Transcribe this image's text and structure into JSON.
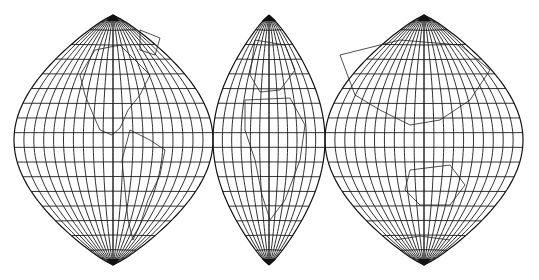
{
  "map": {
    "title": "Interrupted world map projection with three lobes",
    "projection": "interrupted conic-like lobes (Americas, Europe-Africa, Asia-Australia)",
    "colors": {
      "background": "#ffffff",
      "lines": "#1a1a1a"
    },
    "lobes": [
      {
        "name": "Americas",
        "cx": 113,
        "left": 14,
        "right": 213,
        "top": 15,
        "bottom": 265
      },
      {
        "name": "Europe-Africa",
        "cx": 269,
        "left": 213,
        "right": 325,
        "top": 15,
        "bottom": 265
      },
      {
        "name": "Asia-Australia",
        "cx": 424,
        "left": 325,
        "right": 523,
        "top": 15,
        "bottom": 265
      }
    ],
    "graticule": {
      "parallel_count": 17,
      "meridians_per_half_wide": 10,
      "meridians_per_half_narrow": 6
    }
  }
}
